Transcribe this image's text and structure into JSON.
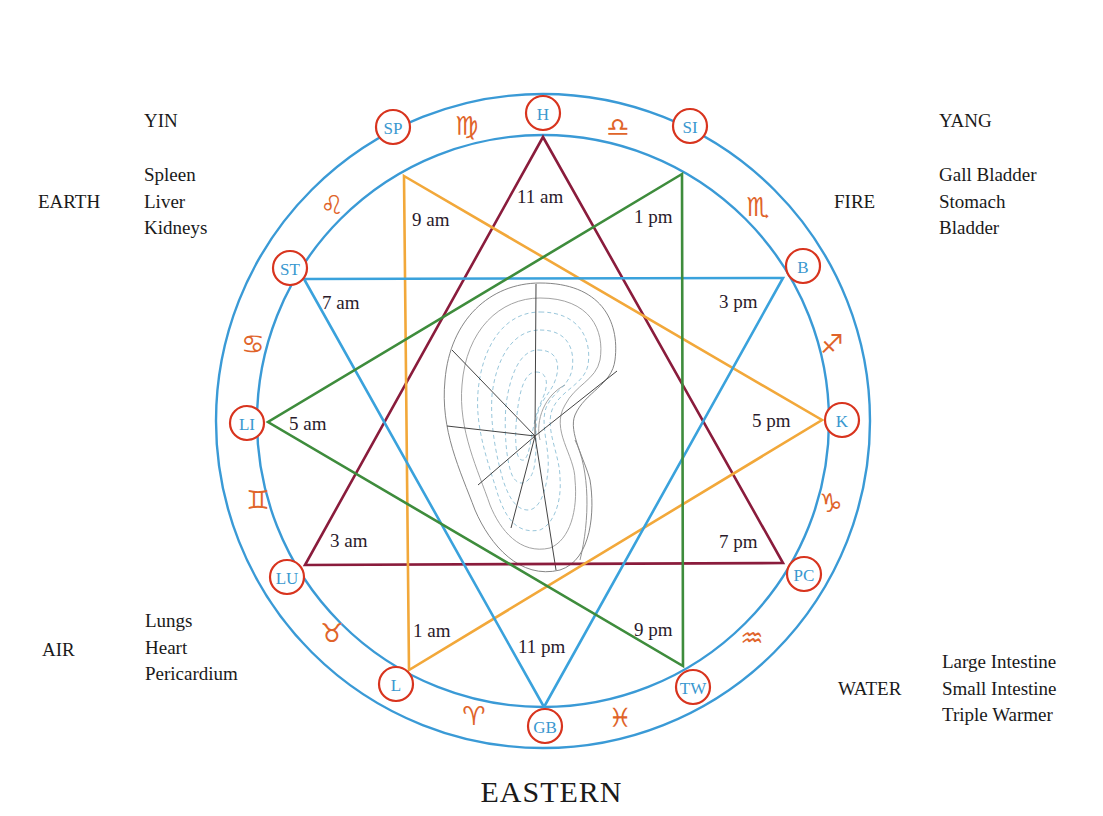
{
  "corners": {
    "top_left": {
      "polarity": "YIN",
      "element": "EARTH",
      "organs": [
        "Spleen",
        "Liver",
        "Kidneys"
      ]
    },
    "top_right": {
      "polarity": "YANG",
      "element": "FIRE",
      "organs": [
        "Gall Bladder",
        "Stomach",
        "Bladder"
      ]
    },
    "bottom_left": {
      "element": "AIR",
      "organs": [
        "Lungs",
        "Heart",
        "Pericardium"
      ]
    },
    "bottom_right": {
      "element": "WATER",
      "organs": [
        "Large Intestine",
        "Small Intestine",
        "Triple Warmer"
      ]
    }
  },
  "title": "EASTERN",
  "colors": {
    "ring": "#3a9ad6",
    "node_stroke": "#d8341e",
    "node_text": "#3a98cf",
    "zodiac": "#e0642a",
    "triangle_maroon": "#8a1c3c",
    "triangle_orange": "#f2a83a",
    "triangle_blue": "#3aa2dc",
    "triangle_green": "#3e8c3c"
  },
  "nodes": [
    {
      "id": "H",
      "label": "H"
    },
    {
      "id": "SI",
      "label": "SI"
    },
    {
      "id": "B",
      "label": "B"
    },
    {
      "id": "K",
      "label": "K"
    },
    {
      "id": "PC",
      "label": "PC"
    },
    {
      "id": "TW",
      "label": "TW"
    },
    {
      "id": "GB",
      "label": "GB"
    },
    {
      "id": "L",
      "label": "L"
    },
    {
      "id": "LU",
      "label": "LU"
    },
    {
      "id": "LI",
      "label": "LI"
    },
    {
      "id": "ST",
      "label": "ST"
    },
    {
      "id": "SP",
      "label": "SP"
    }
  ],
  "times": {
    "H": "11 am",
    "SI": "1 pm",
    "B": "3 pm",
    "K": "5 pm",
    "PC": "7 pm",
    "TW": "9 pm",
    "GB": "11 pm",
    "L": "1 am",
    "LU": "3 am",
    "LI": "5 am",
    "ST": "7 am",
    "SP": "9 am"
  },
  "zodiac": {
    "virgo": "♍",
    "libra": "♎",
    "scorpio": "♏",
    "sagittarius": "♐",
    "capricorn": "♑",
    "aquarius": "♒",
    "pisces": "♓",
    "aries": "♈",
    "taurus": "♉",
    "gemini": "♊",
    "cancer": "♋",
    "leo": "♌"
  },
  "triangles": [
    {
      "name": "maroon",
      "vertices": [
        "H",
        "LU",
        "PC"
      ]
    },
    {
      "name": "orange",
      "vertices": [
        "SP",
        "K",
        "L"
      ]
    },
    {
      "name": "blue",
      "vertices": [
        "ST",
        "B",
        "GB"
      ]
    },
    {
      "name": "green",
      "vertices": [
        "SI",
        "LI",
        "TW"
      ]
    }
  ]
}
